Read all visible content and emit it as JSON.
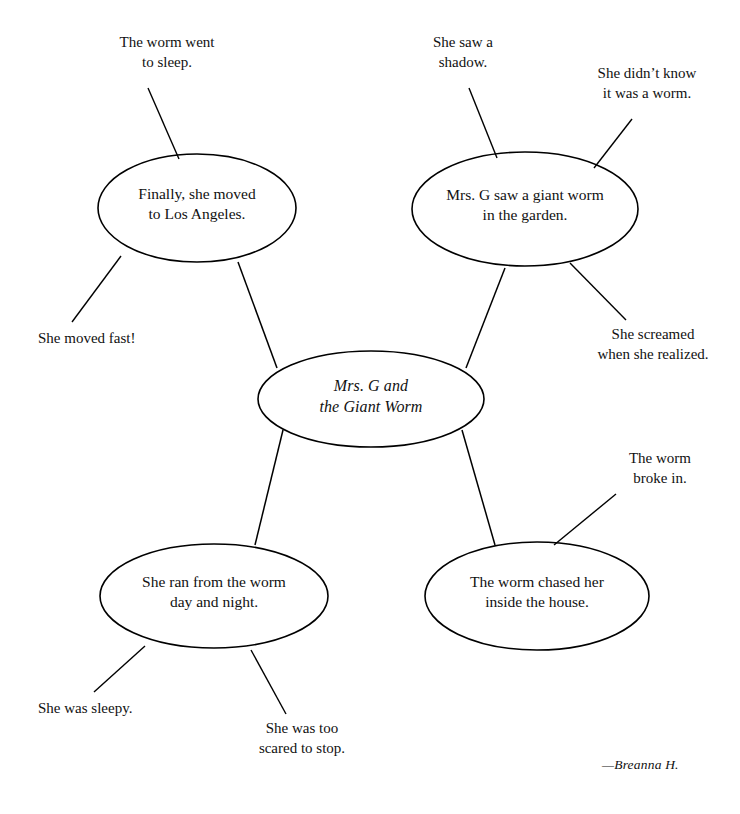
{
  "document": {
    "type": "story-web-graphic-organizer",
    "attribution": "—Breanna H."
  },
  "center_node": {
    "label": "Mrs. G and\nthe Giant Worm"
  },
  "nodes": [
    {
      "id": "top-left",
      "label": "Finally, she moved\nto Los Angeles."
    },
    {
      "id": "top-right",
      "label": "Mrs. G saw a giant worm\nin the garden."
    },
    {
      "id": "bottom-left",
      "label": "She ran from the worm\nday and night."
    },
    {
      "id": "bottom-right",
      "label": "The worm chased her\ninside the house."
    }
  ],
  "details": [
    {
      "id": "worm-went-to-sleep",
      "text": "The worm went\nto sleep."
    },
    {
      "id": "she-moved-fast",
      "text": "She moved fast!"
    },
    {
      "id": "she-saw-a-shadow",
      "text": "She saw a\nshadow."
    },
    {
      "id": "didnt-know-worm",
      "text": "She didn’t know\nit was a worm."
    },
    {
      "id": "she-screamed",
      "text": "She screamed\nwhen she realized."
    },
    {
      "id": "she-was-sleepy",
      "text": "She was sleepy."
    },
    {
      "id": "too-scared-to-stop",
      "text": "She was too\nscared to stop."
    },
    {
      "id": "worm-broke-in",
      "text": "The worm\nbroke in."
    }
  ],
  "colors": {
    "background": "#ffffff",
    "ink": "#000000",
    "text": "#111111"
  }
}
